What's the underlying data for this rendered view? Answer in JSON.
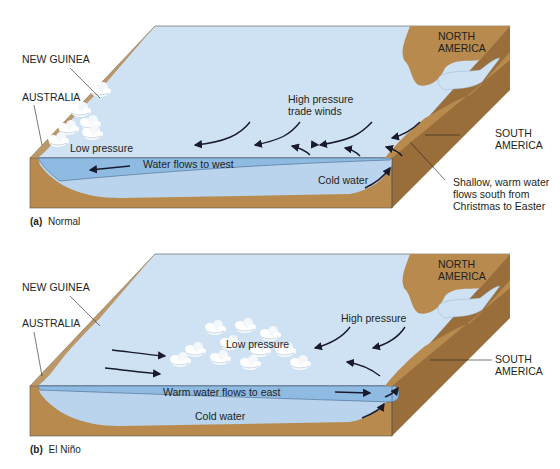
{
  "colors": {
    "ocean_surface": "#cfe2f3",
    "ocean_section": "#b9d4ec",
    "warm_layer": "#8fbbe3",
    "land": "#b88a4e",
    "land_dark": "#9a6e3a",
    "cloud": "#ffffff",
    "arrow": "#1a1a2e",
    "text": "#231f20"
  },
  "panel_a": {
    "caption_letter": "(a)",
    "caption_title": "Normal",
    "labels": {
      "new_guinea": "NEW GUINEA",
      "australia": "AUSTRALIA",
      "north_america_1": "NORTH",
      "north_america_2": "AMERICA",
      "south_america_1": "SOUTH",
      "south_america_2": "AMERICA",
      "low_pressure": "Low pressure",
      "high_pressure_1": "High pressure",
      "high_pressure_2": "trade winds",
      "water_flow": "Water flows to west",
      "cold_water": "Cold water",
      "note_1": "Shallow, warm water",
      "note_2": "flows south from",
      "note_3": "Christmas to Easter"
    }
  },
  "panel_b": {
    "caption_letter": "(b)",
    "caption_title": "El Niño",
    "labels": {
      "new_guinea": "NEW GUINEA",
      "australia": "AUSTRALIA",
      "north_america_1": "NORTH",
      "north_america_2": "AMERICA",
      "south_america_1": "SOUTH",
      "south_america_2": "AMERICA",
      "low_pressure": "Low pressure",
      "high_pressure": "High pressure",
      "water_flow": "Warm water flows to east",
      "cold_water": "Cold water"
    }
  }
}
